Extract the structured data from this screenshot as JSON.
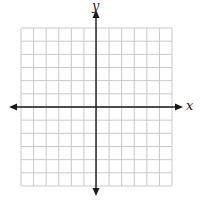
{
  "diagram": {
    "type": "coordinate-plane",
    "axes": {
      "x_label": "x",
      "y_label": "y",
      "arrows": "both-ends"
    },
    "grid": {
      "columns": 12,
      "rows": 12,
      "columns_left_of_y_axis": 6,
      "columns_right_of_y_axis": 6,
      "rows_above_x_axis": 6,
      "rows_below_x_axis": 6,
      "tick_labels": "none"
    },
    "colors": {
      "background": "#ffffff",
      "grid_line": "#c9c9c9",
      "axis": "#1a1a1a",
      "label": "#222222"
    }
  },
  "layout_px": {
    "grid_left": 21,
    "grid_top": 28,
    "grid_right": 172,
    "grid_bottom": 186,
    "origin_x": 96,
    "origin_y": 107,
    "x_axis_start": 9,
    "x_axis_end": 183,
    "y_axis_start": 10,
    "y_axis_end": 196
  }
}
